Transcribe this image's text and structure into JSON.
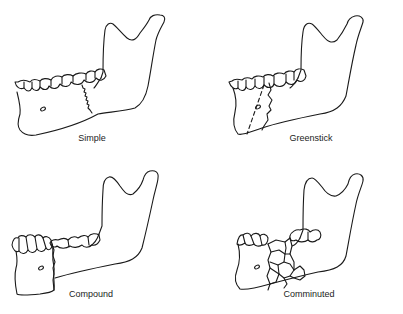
{
  "figure": {
    "panels": [
      {
        "id": "simple",
        "label": "Simple"
      },
      {
        "id": "greenstick",
        "label": "Greenstick"
      },
      {
        "id": "compound",
        "label": "Compound"
      },
      {
        "id": "comminuted",
        "label": "Comminuted"
      }
    ]
  },
  "colors": {
    "line": "#1a1a1a",
    "background": "#ffffff",
    "text": "#222222"
  }
}
